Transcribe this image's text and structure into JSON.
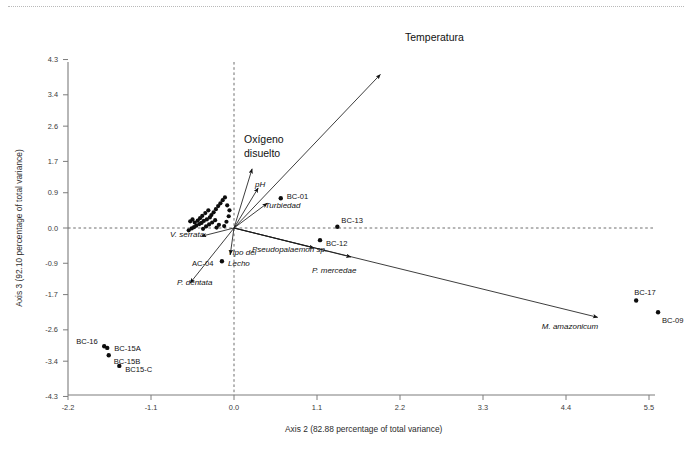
{
  "figure": {
    "title": "",
    "background": "#ffffff",
    "top_rule_color": "#b9b9b9"
  },
  "axes": {
    "x_title": "Axis 2 (82.88 percentage of total variance)",
    "y_title": "Axis 3 (92.10 percentage of total variance)",
    "x_ticks": [
      "-2.2",
      "-1.1",
      "0.0",
      "1.1",
      "2.2",
      "3.3",
      "4.4",
      "5.5"
    ],
    "y_ticks": [
      "4.3",
      "3.4",
      "2.6",
      "1.7",
      "0.9",
      "0.0",
      "-0.9",
      "-1.7",
      "-2.6",
      "-3.4",
      "-4.3"
    ]
  },
  "chart_data": {
    "type": "scatter",
    "title": "",
    "xlabel": "Axis 2 (82.88 percentage of total variance)",
    "ylabel": "Axis 3 (92.10 percentage of total variance)",
    "xlim": [
      -2.2,
      5.5
    ],
    "ylim": [
      -4.3,
      4.3
    ],
    "xticks": [
      -2.2,
      -1.1,
      0.0,
      1.1,
      2.2,
      3.3,
      4.4,
      5.5
    ],
    "yticks": [
      4.3,
      3.4,
      2.6,
      1.7,
      0.9,
      0.0,
      -0.9,
      -1.7,
      -2.6,
      -3.4,
      -4.3
    ],
    "grid": false,
    "legend": "none",
    "zero_lines": true,
    "labeled_points": [
      {
        "label": "BC-01",
        "x": 0.62,
        "y": 0.76,
        "label_dx": 6,
        "label_dy": -2
      },
      {
        "label": "BC-13",
        "x": 1.37,
        "y": 0.03,
        "label_dx": 4,
        "label_dy": -6
      },
      {
        "label": "BC-12",
        "x": 1.14,
        "y": -0.31,
        "label_dx": 6,
        "label_dy": 3
      },
      {
        "label": "BC-17",
        "x": 5.33,
        "y": -1.85,
        "label_dx": -2,
        "label_dy": -8
      },
      {
        "label": "BC-09",
        "x": 5.62,
        "y": -2.15,
        "label_dx": 4,
        "label_dy": 8
      },
      {
        "label": "AC-04",
        "x": -0.16,
        "y": -0.85,
        "label_dx": -30,
        "label_dy": 2
      },
      {
        "label": "BC-16",
        "x": -1.72,
        "y": -3.02,
        "label_dx": -28,
        "label_dy": -5
      },
      {
        "label": "BC-15A",
        "x": -1.68,
        "y": -3.06,
        "label_dx": 7,
        "label_dy": 1
      },
      {
        "label": "BC-15B",
        "x": -1.66,
        "y": -3.25,
        "label_dx": 5,
        "label_dy": 6
      },
      {
        "label": "BC15-C",
        "x": -1.52,
        "y": -3.52,
        "label_dx": 6,
        "label_dy": 3
      }
    ],
    "cluster_points": [
      {
        "x": -0.3,
        "y": 0.33
      },
      {
        "x": -0.32,
        "y": 0.27
      },
      {
        "x": -0.36,
        "y": 0.22
      },
      {
        "x": -0.4,
        "y": 0.18
      },
      {
        "x": -0.43,
        "y": 0.13
      },
      {
        "x": -0.46,
        "y": 0.1
      },
      {
        "x": -0.5,
        "y": 0.06
      },
      {
        "x": -0.53,
        "y": 0.02
      },
      {
        "x": -0.56,
        "y": -0.01
      },
      {
        "x": -0.27,
        "y": 0.4
      },
      {
        "x": -0.24,
        "y": 0.48
      },
      {
        "x": -0.21,
        "y": 0.56
      },
      {
        "x": -0.18,
        "y": 0.63
      },
      {
        "x": -0.15,
        "y": 0.71
      },
      {
        "x": -0.12,
        "y": 0.78
      },
      {
        "x": -0.34,
        "y": 0.45
      },
      {
        "x": -0.38,
        "y": 0.38
      },
      {
        "x": -0.42,
        "y": 0.31
      },
      {
        "x": -0.45,
        "y": 0.25
      },
      {
        "x": -0.48,
        "y": 0.19
      },
      {
        "x": -0.52,
        "y": 0.14
      },
      {
        "x": -0.25,
        "y": 0.2
      },
      {
        "x": -0.29,
        "y": 0.14
      },
      {
        "x": -0.33,
        "y": 0.09
      },
      {
        "x": -0.37,
        "y": 0.04
      },
      {
        "x": -0.41,
        "y": -0.02
      },
      {
        "x": -0.6,
        "y": -0.06
      },
      {
        "x": -0.09,
        "y": 0.58
      },
      {
        "x": -0.06,
        "y": 0.45
      },
      {
        "x": -0.07,
        "y": 0.3
      },
      {
        "x": -0.1,
        "y": 0.16
      },
      {
        "x": -0.13,
        "y": 0.05
      },
      {
        "x": -0.2,
        "y": 0.08
      },
      {
        "x": -0.23,
        "y": 0.01
      },
      {
        "x": -0.55,
        "y": 0.22
      },
      {
        "x": -0.58,
        "y": 0.17
      }
    ],
    "vectors": [
      {
        "name": "Temperatura",
        "x": 1.94,
        "y": 3.92,
        "label": "Temperatura",
        "italic": false,
        "size": "large",
        "label_x": 405,
        "label_y": 41,
        "anchor": "start"
      },
      {
        "name": "Oxigeno disuelto",
        "x": 0.24,
        "y": 1.51,
        "label": "Oxígeno\ndisuelto",
        "italic": false,
        "size": "large",
        "label_x": 244,
        "label_y": 143,
        "anchor": "start"
      },
      {
        "name": "pH",
        "x": 0.32,
        "y": 1.02,
        "label": "pH",
        "italic": true,
        "size": "small",
        "label_x": 255,
        "label_y": 187,
        "anchor": "start"
      },
      {
        "name": "Turbiedad",
        "x": 0.44,
        "y": 0.63,
        "label": "Turbiedad",
        "italic": true,
        "size": "small",
        "label_x": 265,
        "label_y": 208,
        "anchor": "start"
      },
      {
        "name": "V. serrata",
        "x": -0.43,
        "y": -0.21,
        "label": "V. serrata",
        "italic": true,
        "size": "small",
        "label_x": 170,
        "label_y": 237,
        "anchor": "start"
      },
      {
        "name": "P. dentata",
        "x": -0.58,
        "y": -1.4,
        "label": "P. dentata",
        "italic": true,
        "size": "small",
        "label_x": 177,
        "label_y": 285,
        "anchor": "start"
      },
      {
        "name": "Tipo del Lecho",
        "x": -0.05,
        "y": -0.68,
        "label": "Tipo del\nLecho",
        "italic": true,
        "size": "small",
        "label_x": 228,
        "label_y": 255,
        "anchor": "start"
      },
      {
        "name": "Pseudopalaemon sp.",
        "x": 1.06,
        "y": -0.51,
        "label": "Pseudopalaemon sp.",
        "italic": true,
        "size": "small",
        "label_x": 252,
        "label_y": 252,
        "anchor": "start"
      },
      {
        "name": "M. amazonicum",
        "x": 4.82,
        "y": -2.28,
        "label": "M. amazonicum",
        "italic": true,
        "size": "small",
        "label_x": 570,
        "label_y": 329,
        "anchor": "middle"
      },
      {
        "name": "P. mercedae",
        "x": 1.55,
        "y": -0.74,
        "label": "P. mercedae",
        "italic": true,
        "size": "small",
        "label_x": 312,
        "label_y": 273,
        "anchor": "start"
      }
    ]
  }
}
